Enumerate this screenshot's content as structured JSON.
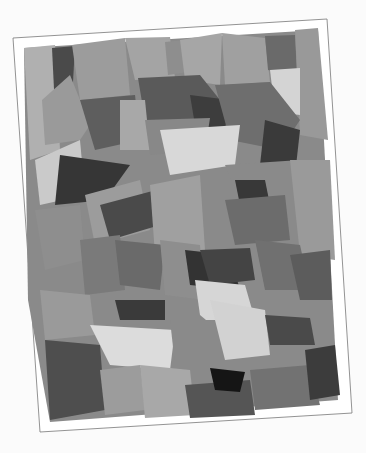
{
  "artwork": {
    "subject": "abstract grayscale torn-paper collage on a tilted white card",
    "card": {
      "corners": [
        [
          13,
          38
        ],
        [
          327,
          19
        ],
        [
          352,
          413
        ],
        [
          40,
          432
        ]
      ],
      "fill": "#ffffff",
      "border": "#777777"
    },
    "palette": {
      "lightest": "#d6d6d6",
      "light": "#aaaaaa",
      "mid": "#8c8c8c",
      "dark": "#5e5e5e",
      "darkest": "#2e2e2e"
    }
  }
}
